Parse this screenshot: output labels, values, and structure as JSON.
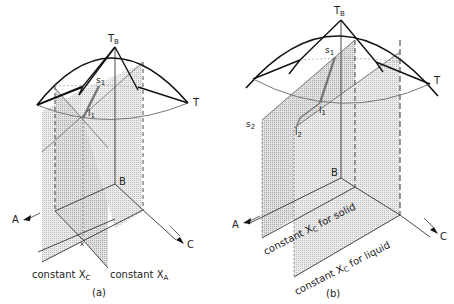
{
  "figure": {
    "panels": [
      {
        "id": "a",
        "caption": "(a)",
        "labels": {
          "apex": {
            "main": "T",
            "sub": "B"
          },
          "right_vertex": "T",
          "solid_point": {
            "main": "s",
            "sub": "1"
          },
          "liquid_point": {
            "main": "l",
            "sub": "1"
          },
          "base_vertex": "B",
          "axis_a": "A",
          "axis_c": "C",
          "point_x": "x",
          "plane_1": {
            "main": "constant X",
            "sub": "C"
          },
          "plane_2": {
            "main": "constant X",
            "sub": "A"
          }
        }
      },
      {
        "id": "b",
        "caption": "(b)",
        "labels": {
          "apex": {
            "main": "T",
            "sub": "B"
          },
          "right_vertex": "T",
          "solid_point_1": {
            "main": "s",
            "sub": "1"
          },
          "liquid_point_1": {
            "main": "l",
            "sub": "1"
          },
          "solid_point_2": {
            "main": "s",
            "sub": "2"
          },
          "liquid_point_2": {
            "main": "l",
            "sub": "2"
          },
          "base_vertex": "B",
          "axis_a": "A",
          "axis_c": "C",
          "plane_solid": {
            "main": "constant X",
            "sub": "C",
            "suffix": " for solid"
          },
          "plane_liquid": {
            "main": "constant X",
            "sub": "C",
            "suffix": " for liquid"
          }
        }
      }
    ],
    "colors": {
      "line": "#111111",
      "gray_line": "#777777",
      "shade_light": "#e6e6e6",
      "shade_dot": "#cfcfcf"
    }
  }
}
